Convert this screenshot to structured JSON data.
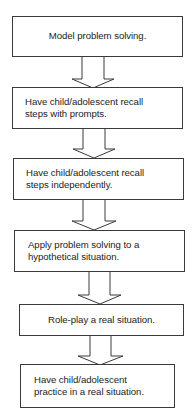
{
  "diagram": {
    "type": "vertical-flowchart",
    "colors": {
      "stroke": "#3a3a3a",
      "fill": "#ffffff",
      "text": "#222222",
      "background": "#ffffff"
    },
    "steps": [
      {
        "id": "step-1",
        "label": "Model problem solving.",
        "align": "center"
      },
      {
        "id": "step-2",
        "label": "Have child/adolescent recall\nsteps with prompts.",
        "align": "left"
      },
      {
        "id": "step-3",
        "label": "Have child/adolescent recall\nsteps independently.",
        "align": "left"
      },
      {
        "id": "step-4",
        "label": "Apply problem solving to a\nhypothetical situation.",
        "align": "left"
      },
      {
        "id": "step-5",
        "label": "Role-play a real situation.",
        "align": "center"
      },
      {
        "id": "step-6",
        "label": "Have child/adolescent\npractice in a real situation.",
        "align": "left"
      }
    ],
    "connectors": [
      {
        "from": "step-1",
        "to": "step-2",
        "style": "block-arrow-down"
      },
      {
        "from": "step-2",
        "to": "step-3",
        "style": "block-arrow-down"
      },
      {
        "from": "step-3",
        "to": "step-4",
        "style": "block-arrow-down"
      },
      {
        "from": "step-4",
        "to": "step-5",
        "style": "block-arrow-down"
      },
      {
        "from": "step-5",
        "to": "step-6",
        "style": "block-arrow-down"
      }
    ]
  }
}
